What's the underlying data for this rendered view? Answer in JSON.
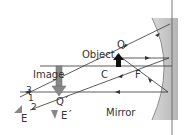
{
  "diagram": {
    "labels": {
      "object": "Object",
      "q": "Q",
      "image": "Image",
      "c": "C",
      "f": "F",
      "mirror": "Mirror",
      "q_prime": "Q´",
      "ray_1": "1",
      "ray_2": "2",
      "ray_3": "3",
      "eye_e": "E",
      "eye_e_prime": "E´"
    },
    "colors": {
      "ray": "#333333",
      "mirror_fill": "#bdbdbd",
      "mirror_edge": "#555555",
      "object_arrow": "#111111",
      "image_arrow": "#777777",
      "text": "#333333"
    }
  }
}
